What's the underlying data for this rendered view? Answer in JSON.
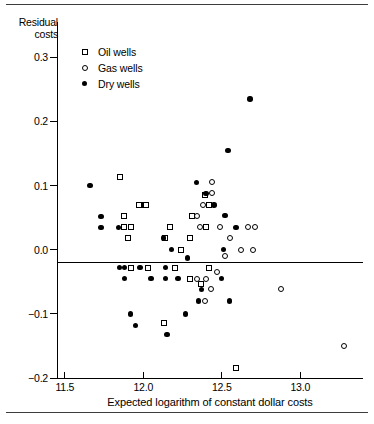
{
  "figure": {
    "has_top_rule": true,
    "has_bottom_rule": true,
    "background": "#ffffff",
    "ink": "#000000"
  },
  "legend": {
    "position": "top-left-inside",
    "entries": [
      {
        "label": "Oil wells",
        "marker": "open-square",
        "series": "oil"
      },
      {
        "label": "Gas wells",
        "marker": "open-circle",
        "series": "gas"
      },
      {
        "label": "Dry wells",
        "marker": "filled-circle",
        "series": "dry"
      }
    ]
  },
  "chart_data": {
    "type": "scatter",
    "title": "",
    "xlabel": "Expected logarithm of constant dollar costs",
    "ylabel": "Residual costs",
    "ylabel_lines": [
      "Residual",
      "costs"
    ],
    "xlim": [
      11.45,
      13.4
    ],
    "ylim": [
      -0.2,
      0.355
    ],
    "xticks": [
      11.5,
      12.0,
      12.5,
      13.0
    ],
    "xticklabels": [
      "11.5",
      "12.0",
      "12.5",
      "13.0"
    ],
    "yticks": [
      0.3,
      0.2,
      0.1,
      0.0,
      -0.1,
      -0.2
    ],
    "yticklabels": [
      "0.3",
      "0.2",
      "0.1",
      "0.0",
      "-0.1",
      "-0.2"
    ],
    "grid": false,
    "zero_reference_line": 0.0,
    "series": [
      {
        "name": "Oil wells",
        "marker": "open-square",
        "points": [
          [
            11.85,
            0.113
          ],
          [
            11.98,
            0.069
          ],
          [
            12.05,
            12.05
          ],
          [
            11.97,
            0.069
          ],
          [
            12.02,
            0.069
          ],
          [
            11.88,
            0.052
          ],
          [
            11.88,
            0.035
          ],
          [
            11.92,
            0.035
          ],
          [
            11.9,
            0.018
          ],
          [
            12.14,
            0.018
          ],
          [
            12.39,
            0.085
          ],
          [
            12.42,
            0.069
          ],
          [
            12.31,
            0.053
          ],
          [
            12.4,
            0.035
          ],
          [
            12.3,
            0.018
          ],
          [
            12.17,
            0.035
          ],
          [
            12.24,
            0.0
          ],
          [
            11.92,
            -0.028
          ],
          [
            12.03,
            -0.028
          ],
          [
            12.2,
            -0.028
          ],
          [
            12.42,
            -0.028
          ],
          [
            12.3,
            -0.045
          ],
          [
            12.37,
            -0.053
          ],
          [
            12.13,
            -0.115
          ],
          [
            12.59,
            -0.185
          ]
        ]
      },
      {
        "name": "Gas wells",
        "marker": "open-circle",
        "points": [
          [
            12.44,
            0.105
          ],
          [
            12.44,
            0.088
          ],
          [
            12.38,
            0.07
          ],
          [
            12.34,
            0.053
          ],
          [
            12.36,
            0.035
          ],
          [
            12.49,
            0.035
          ],
          [
            12.67,
            0.035
          ],
          [
            12.71,
            0.035
          ],
          [
            12.55,
            0.018
          ],
          [
            12.62,
            0.0
          ],
          [
            12.7,
            0.0
          ],
          [
            12.52,
            -0.01
          ],
          [
            12.47,
            -0.035
          ],
          [
            12.34,
            -0.045
          ],
          [
            12.4,
            -0.045
          ],
          [
            12.43,
            -0.062
          ],
          [
            12.39,
            -0.08
          ],
          [
            12.88,
            -0.062
          ],
          [
            13.28,
            -0.15
          ]
        ]
      },
      {
        "name": "Dry wells",
        "marker": "filled-circle",
        "points": [
          [
            12.68,
            0.235
          ],
          [
            12.54,
            0.155
          ],
          [
            11.66,
            0.1
          ],
          [
            11.73,
            0.052
          ],
          [
            11.73,
            0.035
          ],
          [
            11.84,
            0.035
          ],
          [
            12.34,
            0.105
          ],
          [
            12.4,
            0.088
          ],
          [
            12.45,
            0.07
          ],
          [
            12.52,
            0.053
          ],
          [
            12.59,
            0.035
          ],
          [
            12.13,
            0.018
          ],
          [
            12.18,
            0.0
          ],
          [
            12.51,
            0.0
          ],
          [
            11.85,
            -0.028
          ],
          [
            11.88,
            -0.028
          ],
          [
            11.98,
            -0.028
          ],
          [
            12.14,
            -0.028
          ],
          [
            12.28,
            -0.013
          ],
          [
            11.88,
            -0.045
          ],
          [
            12.05,
            -0.045
          ],
          [
            12.14,
            -0.045
          ],
          [
            12.22,
            -0.045
          ],
          [
            12.5,
            -0.045
          ],
          [
            12.37,
            -0.062
          ],
          [
            11.92,
            -0.1
          ],
          [
            12.27,
            -0.1
          ],
          [
            12.55,
            -0.08
          ],
          [
            11.95,
            -0.118
          ],
          [
            12.15,
            -0.132
          ],
          [
            12.35,
            -0.08
          ]
        ]
      }
    ]
  }
}
